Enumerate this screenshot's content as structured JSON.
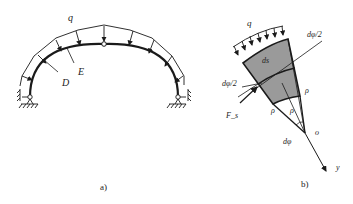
{
  "figure_a": {
    "caption": "a)",
    "load_label": "q",
    "point_D": "D",
    "point_E": "E"
  },
  "figure_b": {
    "caption": "b)",
    "load_label": "q",
    "element_label": "ds",
    "half_angle_top": "dφ/2",
    "half_angle_left": "dφ/2",
    "radius_right": "ρ",
    "radius_mid": "ρ",
    "radius_left": "ρ",
    "angle_label": "dφ",
    "center_label": "o",
    "axis_label": "y",
    "force_label": "F_s"
  },
  "colors": {
    "line": "#1a1a1a",
    "element_fill": "#9a9a9a",
    "background": "#ffffff"
  }
}
